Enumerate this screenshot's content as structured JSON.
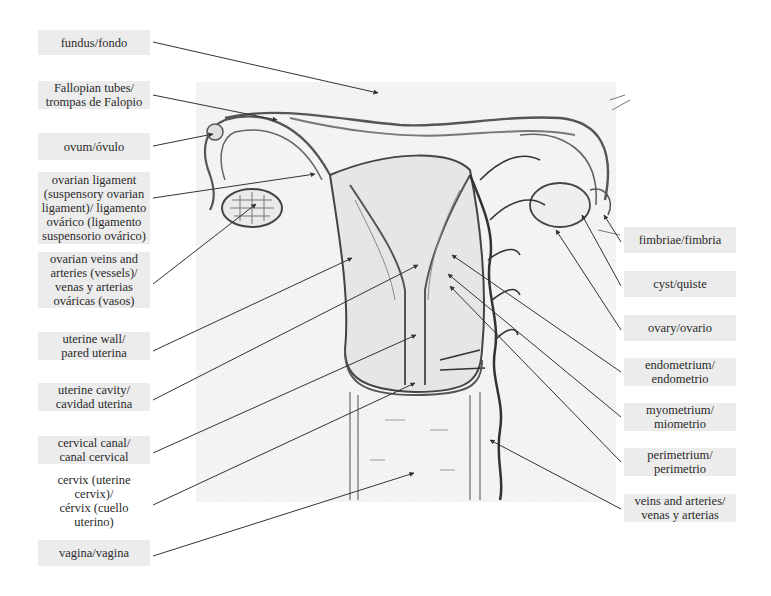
{
  "diagram": {
    "left_labels": [
      {
        "id": "fundus",
        "text": "fundus/fondo",
        "x": 38,
        "y": 30,
        "w": 112,
        "h": 25
      },
      {
        "id": "fallopian-tubes",
        "text": "Fallopian tubes/\ntrompas de Falopio",
        "x": 38,
        "y": 81,
        "w": 112,
        "h": 28
      },
      {
        "id": "ovum",
        "text": "ovum/óvulo",
        "x": 38,
        "y": 133,
        "w": 112,
        "h": 27
      },
      {
        "id": "ovarian-ligament",
        "text": "ovarian ligament\n(suspensory ovarian\nligament)/ ligamento\novárico (ligamento\nsuspensorio ovárico)",
        "x": 38,
        "y": 172,
        "w": 112,
        "h": 72
      },
      {
        "id": "ovarian-vessels",
        "text": "ovarian veins and\narteries (vessels)/\nvenas y arterias\nováricas (vasos)",
        "x": 38,
        "y": 252,
        "w": 112,
        "h": 56
      },
      {
        "id": "uterine-wall",
        "text": "uterine wall/\npared uterina",
        "x": 38,
        "y": 332,
        "w": 112,
        "h": 28
      },
      {
        "id": "uterine-cavity",
        "text": "uterine cavity/\ncavidad uterina",
        "x": 38,
        "y": 383,
        "w": 112,
        "h": 28
      },
      {
        "id": "cervical-canal",
        "text": "cervical canal/\ncanal cervical",
        "x": 38,
        "y": 436,
        "w": 112,
        "h": 28
      },
      {
        "id": "cervix",
        "text": "cervix (uterine cervix)/\ncérvix (cuello uterino)",
        "x": 36,
        "y": 486,
        "w": 116,
        "h": 30
      },
      {
        "id": "vagina",
        "text": "vagina/vagina",
        "x": 38,
        "y": 540,
        "w": 112,
        "h": 26
      }
    ],
    "right_labels": [
      {
        "id": "fimbriae",
        "text": "fimbriae/fimbria",
        "x": 624,
        "y": 227,
        "w": 112,
        "h": 26
      },
      {
        "id": "cyst",
        "text": "cyst/quiste",
        "x": 624,
        "y": 271,
        "w": 112,
        "h": 26
      },
      {
        "id": "ovary",
        "text": "ovary/ovario",
        "x": 624,
        "y": 315,
        "w": 112,
        "h": 26
      },
      {
        "id": "endometrium",
        "text": "endometrium/\nendometrio",
        "x": 624,
        "y": 358,
        "w": 112,
        "h": 28
      },
      {
        "id": "myometrium",
        "text": "myometrium/\nmiometrio",
        "x": 624,
        "y": 403,
        "w": 112,
        "h": 28
      },
      {
        "id": "perimetrium",
        "text": "perimetrium/\nperimetrio",
        "x": 624,
        "y": 448,
        "w": 112,
        "h": 28
      },
      {
        "id": "veins-arteries",
        "text": "veins and arteries/\nvenas y arterias",
        "x": 624,
        "y": 494,
        "w": 112,
        "h": 28
      }
    ],
    "leader_lines": [
      {
        "from": [
          153,
          42
        ],
        "to": [
          378,
          93
        ]
      },
      {
        "from": [
          153,
          95
        ],
        "to": [
          277,
          120
        ]
      },
      {
        "from": [
          153,
          146
        ],
        "to": [
          213,
          134
        ]
      },
      {
        "from": [
          153,
          198
        ],
        "to": [
          315,
          174
        ]
      },
      {
        "from": [
          153,
          284
        ],
        "to": [
          256,
          204
        ]
      },
      {
        "from": [
          153,
          351
        ],
        "to": [
          352,
          258
        ]
      },
      {
        "from": [
          153,
          400
        ],
        "to": [
          418,
          265
        ]
      },
      {
        "from": [
          153,
          453
        ],
        "to": [
          416,
          335
        ]
      },
      {
        "from": [
          153,
          505
        ],
        "to": [
          415,
          383
        ]
      },
      {
        "from": [
          153,
          556
        ],
        "to": [
          414,
          473
        ]
      },
      {
        "from": [
          621,
          242
        ],
        "to": [
          604,
          215
        ]
      },
      {
        "from": [
          621,
          286
        ],
        "to": [
          582,
          215
        ]
      },
      {
        "from": [
          621,
          330
        ],
        "to": [
          556,
          230
        ]
      },
      {
        "from": [
          621,
          372
        ],
        "to": [
          452,
          255
        ]
      },
      {
        "from": [
          621,
          417
        ],
        "to": [
          448,
          274
        ]
      },
      {
        "from": [
          621,
          462
        ],
        "to": [
          450,
          286
        ]
      },
      {
        "from": [
          621,
          509
        ],
        "to": [
          490,
          440
        ]
      }
    ]
  }
}
